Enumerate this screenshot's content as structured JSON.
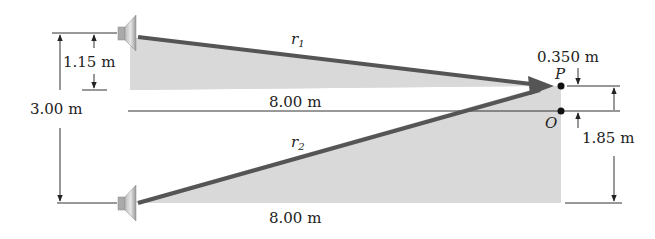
{
  "diagram": {
    "type": "two-source interference geometry",
    "colors": {
      "shade": "#d8d8d8",
      "ray": "#555555",
      "dim_line": "#333333",
      "speaker_light": "#c8c8c8",
      "speaker_dark": "#8a8a8a",
      "point": "#111111"
    },
    "labels": {
      "r1": "r",
      "r1_sub": "1",
      "r2": "r",
      "r2_sub": "2",
      "top_distance": "8.00 m",
      "bottom_distance": "8.00 m",
      "speaker_offset": "1.15 m",
      "speaker_separation": "3.00 m",
      "p_offset": "0.350 m",
      "o_offset": "1.85 m",
      "point_p": "P",
      "point_o": "O"
    },
    "points": [
      {
        "name": "P",
        "x": 561,
        "y": 86
      },
      {
        "name": "O",
        "x": 561,
        "y": 111
      }
    ],
    "speakers": [
      {
        "name": "speaker-top",
        "x": 130,
        "y": 33
      },
      {
        "name": "speaker-bottom",
        "x": 130,
        "y": 203
      }
    ]
  }
}
